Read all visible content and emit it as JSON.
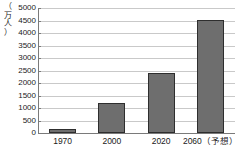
{
  "chart_data": {
    "type": "bar",
    "title": "",
    "xlabel": "",
    "ylabel": "（万人）",
    "ylabel_chars": [
      "（",
      "万",
      "人",
      "）"
    ],
    "categories": [
      "1970",
      "2000",
      "2020",
      "2060（予想）"
    ],
    "values": [
      150,
      1200,
      2400,
      4540
    ],
    "ylim": [
      0,
      5000
    ],
    "ytick_labels": [
      "5000",
      "4500",
      "4000",
      "3500",
      "3000",
      "2500",
      "2000",
      "1500",
      "1000",
      "500",
      "0"
    ],
    "ytick_values": [
      5000,
      4500,
      4000,
      3500,
      3000,
      2500,
      2000,
      1500,
      1000,
      500,
      0
    ],
    "grid": true,
    "legend": false,
    "bar_color": "#6e6e6e",
    "bar_border_color": "#2e2e2e",
    "grid_color": "#c9c9c9",
    "axis_color": "#7a7a7a",
    "background": "#ffffff"
  }
}
